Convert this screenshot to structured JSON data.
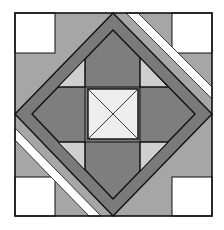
{
  "figure": {
    "colors": {
      "background": "#ffffff",
      "white_patch": "#ffffff",
      "corner_gray": "#a6a6a6",
      "band_dark": "#7a7a7a",
      "mid_gray": "#7e7e7e",
      "light_gray": "#cfcfcf",
      "center_light": "#eeeeee",
      "line": "#111111"
    },
    "block": {
      "x": 15,
      "y": 13,
      "width": 197,
      "height": 203
    },
    "corner_squares": [
      {
        "name": "top-left",
        "x": 15,
        "y": 13,
        "w": 40,
        "h": 40
      },
      {
        "name": "top-right",
        "x": 172,
        "y": 13,
        "w": 40,
        "h": 40
      },
      {
        "name": "bottom-left",
        "x": 15,
        "y": 177,
        "w": 40,
        "h": 39
      },
      {
        "name": "bottom-right",
        "x": 172,
        "y": 177,
        "w": 40,
        "h": 39
      }
    ],
    "center_square": {
      "x": 88,
      "y": 89,
      "w": 50,
      "h": 50
    }
  }
}
